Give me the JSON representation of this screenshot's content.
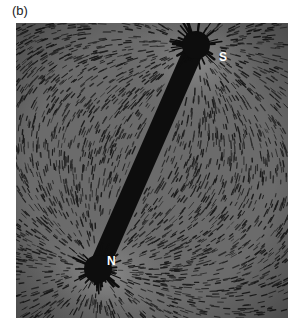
{
  "figure": {
    "panel_label": "(b)",
    "poles": {
      "south_label": "S",
      "north_label": "N"
    },
    "colors": {
      "background": "#6e6e6e",
      "magnet": "#0d0d0d",
      "filings": "#1c1c1c",
      "pole_text": "#ffffff"
    }
  }
}
